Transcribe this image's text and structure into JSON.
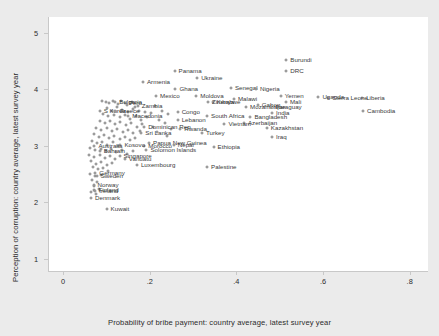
{
  "chart_data": {
    "type": "scatter",
    "title": "",
    "xlabel": "Probability of bribe payment: country average, latest survey year",
    "ylabel": "Perception of corruption: country average, latest survey year",
    "xlim": [
      -0.035,
      0.84
    ],
    "ylim": [
      0.78,
      5.28
    ],
    "xticks": [
      0,
      0.2,
      0.4,
      0.6,
      0.8
    ],
    "xticklabels": [
      "0",
      ".2",
      ".4",
      ".6",
      ".8"
    ],
    "yticks": [
      1,
      2,
      3,
      4,
      5
    ],
    "yticklabels": [
      "1",
      "2",
      "3",
      "4",
      "5"
    ],
    "grid": false,
    "legend": null,
    "marker": "open-circle",
    "points": [
      {
        "label": "Burundi",
        "x": 0.513,
        "y": 4.52
      },
      {
        "label": "DRC",
        "x": 0.513,
        "y": 4.33
      },
      {
        "label": "Panama",
        "x": 0.255,
        "y": 4.32
      },
      {
        "label": "Ukraine",
        "x": 0.307,
        "y": 4.2
      },
      {
        "label": "Armenia",
        "x": 0.182,
        "y": 4.12
      },
      {
        "label": "Senegal",
        "x": 0.385,
        "y": 4.02
      },
      {
        "label": "Nigeria",
        "x": 0.443,
        "y": 4.0
      },
      {
        "label": "Ghana",
        "x": 0.257,
        "y": 4.0
      },
      {
        "label": "Liberia",
        "x": 0.688,
        "y": 3.85
      },
      {
        "label": "Sierra Leone",
        "x": 0.61,
        "y": 3.85
      },
      {
        "label": "Uganda",
        "x": 0.587,
        "y": 3.87
      },
      {
        "label": "Yemen",
        "x": 0.5,
        "y": 3.88
      },
      {
        "label": "Malawi",
        "x": 0.392,
        "y": 3.82
      },
      {
        "label": "Mexico",
        "x": 0.212,
        "y": 3.88
      },
      {
        "label": "Moldova",
        "x": 0.305,
        "y": 3.88
      },
      {
        "label": "Kenya",
        "x": 0.343,
        "y": 3.78
      },
      {
        "label": "Zimbabwe",
        "x": 0.332,
        "y": 3.78
      },
      {
        "label": "Gabon",
        "x": 0.447,
        "y": 3.72
      },
      {
        "label": "Mali",
        "x": 0.512,
        "y": 3.78
      },
      {
        "label": "Mozambique",
        "x": 0.42,
        "y": 3.68
      },
      {
        "label": "Paraguay",
        "x": 0.478,
        "y": 3.68
      },
      {
        "label": "Cambodia",
        "x": 0.69,
        "y": 3.62
      },
      {
        "label": "Zambia",
        "x": 0.17,
        "y": 3.7
      },
      {
        "label": "S Korea",
        "x": 0.082,
        "y": 3.62
      },
      {
        "label": "Peru",
        "x": 0.14,
        "y": 3.76
      },
      {
        "label": "Bulgaria",
        "x": 0.118,
        "y": 3.77
      },
      {
        "label": "Greece",
        "x": 0.118,
        "y": 3.62
      },
      {
        "label": "Congo",
        "x": 0.262,
        "y": 3.6
      },
      {
        "label": "India",
        "x": 0.48,
        "y": 3.58
      },
      {
        "label": "South Africa",
        "x": 0.33,
        "y": 3.52
      },
      {
        "label": "Bangladesh",
        "x": 0.43,
        "y": 3.5
      },
      {
        "label": "Macedonia",
        "x": 0.148,
        "y": 3.52
      },
      {
        "label": "Lebanon",
        "x": 0.262,
        "y": 3.45
      },
      {
        "label": "Azerbaijan",
        "x": 0.415,
        "y": 3.4
      },
      {
        "label": "Vietnam",
        "x": 0.37,
        "y": 3.38
      },
      {
        "label": "Dominican Rep",
        "x": 0.185,
        "y": 3.34
      },
      {
        "label": "Rwanda",
        "x": 0.268,
        "y": 3.3
      },
      {
        "label": "Kazakhstan",
        "x": 0.468,
        "y": 3.32
      },
      {
        "label": "Turkey",
        "x": 0.318,
        "y": 3.22
      },
      {
        "label": "Sri Lanka",
        "x": 0.178,
        "y": 3.22
      },
      {
        "label": "Iraq",
        "x": 0.48,
        "y": 3.15
      },
      {
        "label": "Papua New Guinea",
        "x": 0.196,
        "y": 3.05
      },
      {
        "label": "Nepal",
        "x": 0.253,
        "y": 3.02
      },
      {
        "label": "Morocco",
        "x": 0.185,
        "y": 3.0
      },
      {
        "label": "Ethiopia",
        "x": 0.345,
        "y": 2.98
      },
      {
        "label": "Kosovo",
        "x": 0.13,
        "y": 3.02
      },
      {
        "label": "Australia",
        "x": 0.07,
        "y": 3.0
      },
      {
        "label": "Solomon Islands",
        "x": 0.19,
        "y": 2.92
      },
      {
        "label": "Bahrain",
        "x": 0.082,
        "y": 2.9
      },
      {
        "label": "Singapore",
        "x": 0.128,
        "y": 2.82
      },
      {
        "label": "Vanuatu",
        "x": 0.14,
        "y": 2.76
      },
      {
        "label": "Luxembourg",
        "x": 0.168,
        "y": 2.66
      },
      {
        "label": "Palestine",
        "x": 0.33,
        "y": 2.62
      },
      {
        "label": "Germany",
        "x": 0.072,
        "y": 2.52
      },
      {
        "label": "Sweden",
        "x": 0.075,
        "y": 2.46
      },
      {
        "label": "Norway",
        "x": 0.068,
        "y": 2.3
      },
      {
        "label": "Finland",
        "x": 0.07,
        "y": 2.22
      },
      {
        "label": "Ireland",
        "x": 0.072,
        "y": 2.2
      },
      {
        "label": "Denmark",
        "x": 0.062,
        "y": 2.08
      },
      {
        "label": "Kuwait",
        "x": 0.098,
        "y": 1.88
      }
    ],
    "cluster_points": [
      {
        "x": 0.088,
        "y": 3.8
      },
      {
        "x": 0.096,
        "y": 3.78
      },
      {
        "x": 0.104,
        "y": 3.76
      },
      {
        "x": 0.112,
        "y": 3.79
      },
      {
        "x": 0.124,
        "y": 3.74
      },
      {
        "x": 0.132,
        "y": 3.8
      },
      {
        "x": 0.145,
        "y": 3.72
      },
      {
        "x": 0.156,
        "y": 3.78
      },
      {
        "x": 0.164,
        "y": 3.69
      },
      {
        "x": 0.1,
        "y": 3.66
      },
      {
        "x": 0.11,
        "y": 3.62
      },
      {
        "x": 0.122,
        "y": 3.68
      },
      {
        "x": 0.134,
        "y": 3.64
      },
      {
        "x": 0.148,
        "y": 3.6
      },
      {
        "x": 0.16,
        "y": 3.65
      },
      {
        "x": 0.172,
        "y": 3.62
      },
      {
        "x": 0.186,
        "y": 3.6
      },
      {
        "x": 0.2,
        "y": 3.58
      },
      {
        "x": 0.09,
        "y": 3.56
      },
      {
        "x": 0.102,
        "y": 3.52
      },
      {
        "x": 0.116,
        "y": 3.55
      },
      {
        "x": 0.128,
        "y": 3.5
      },
      {
        "x": 0.14,
        "y": 3.54
      },
      {
        "x": 0.152,
        "y": 3.48
      },
      {
        "x": 0.166,
        "y": 3.52
      },
      {
        "x": 0.178,
        "y": 3.46
      },
      {
        "x": 0.192,
        "y": 3.5
      },
      {
        "x": 0.082,
        "y": 3.44
      },
      {
        "x": 0.094,
        "y": 3.4
      },
      {
        "x": 0.106,
        "y": 3.43
      },
      {
        "x": 0.118,
        "y": 3.38
      },
      {
        "x": 0.13,
        "y": 3.42
      },
      {
        "x": 0.142,
        "y": 3.36
      },
      {
        "x": 0.154,
        "y": 3.4
      },
      {
        "x": 0.168,
        "y": 3.34
      },
      {
        "x": 0.18,
        "y": 3.38
      },
      {
        "x": 0.074,
        "y": 3.32
      },
      {
        "x": 0.086,
        "y": 3.28
      },
      {
        "x": 0.098,
        "y": 3.31
      },
      {
        "x": 0.11,
        "y": 3.26
      },
      {
        "x": 0.122,
        "y": 3.3
      },
      {
        "x": 0.136,
        "y": 3.24
      },
      {
        "x": 0.148,
        "y": 3.28
      },
      {
        "x": 0.16,
        "y": 3.22
      },
      {
        "x": 0.174,
        "y": 3.26
      },
      {
        "x": 0.068,
        "y": 3.2
      },
      {
        "x": 0.08,
        "y": 3.16
      },
      {
        "x": 0.092,
        "y": 3.19
      },
      {
        "x": 0.104,
        "y": 3.14
      },
      {
        "x": 0.116,
        "y": 3.18
      },
      {
        "x": 0.128,
        "y": 3.12
      },
      {
        "x": 0.14,
        "y": 3.16
      },
      {
        "x": 0.152,
        "y": 3.1
      },
      {
        "x": 0.164,
        "y": 3.14
      },
      {
        "x": 0.064,
        "y": 3.08
      },
      {
        "x": 0.076,
        "y": 3.04
      },
      {
        "x": 0.088,
        "y": 3.07
      },
      {
        "x": 0.1,
        "y": 3.02
      },
      {
        "x": 0.112,
        "y": 3.06
      },
      {
        "x": 0.124,
        "y": 3.0
      },
      {
        "x": 0.06,
        "y": 2.96
      },
      {
        "x": 0.072,
        "y": 2.92
      },
      {
        "x": 0.084,
        "y": 2.95
      },
      {
        "x": 0.096,
        "y": 2.9
      },
      {
        "x": 0.108,
        "y": 2.94
      },
      {
        "x": 0.12,
        "y": 2.88
      },
      {
        "x": 0.134,
        "y": 2.92
      },
      {
        "x": 0.146,
        "y": 2.86
      },
      {
        "x": 0.158,
        "y": 2.9
      },
      {
        "x": 0.058,
        "y": 2.84
      },
      {
        "x": 0.07,
        "y": 2.8
      },
      {
        "x": 0.082,
        "y": 2.83
      },
      {
        "x": 0.094,
        "y": 2.78
      },
      {
        "x": 0.106,
        "y": 2.82
      },
      {
        "x": 0.118,
        "y": 2.76
      },
      {
        "x": 0.062,
        "y": 2.72
      },
      {
        "x": 0.074,
        "y": 2.68
      },
      {
        "x": 0.086,
        "y": 2.71
      },
      {
        "x": 0.098,
        "y": 2.66
      },
      {
        "x": 0.11,
        "y": 2.7
      },
      {
        "x": 0.066,
        "y": 2.62
      },
      {
        "x": 0.078,
        "y": 2.58
      },
      {
        "x": 0.09,
        "y": 2.6
      },
      {
        "x": 0.102,
        "y": 2.56
      },
      {
        "x": 0.06,
        "y": 2.5
      },
      {
        "x": 0.072,
        "y": 2.46
      },
      {
        "x": 0.084,
        "y": 2.48
      },
      {
        "x": 0.064,
        "y": 2.4
      },
      {
        "x": 0.076,
        "y": 2.36
      },
      {
        "x": 0.068,
        "y": 2.28
      },
      {
        "x": 0.08,
        "y": 2.24
      },
      {
        "x": 0.062,
        "y": 2.18
      },
      {
        "x": 0.074,
        "y": 2.14
      },
      {
        "x": 0.21,
        "y": 3.7
      },
      {
        "x": 0.225,
        "y": 3.62
      },
      {
        "x": 0.24,
        "y": 3.56
      },
      {
        "x": 0.218,
        "y": 3.46
      },
      {
        "x": 0.232,
        "y": 3.4
      },
      {
        "x": 0.205,
        "y": 3.34
      },
      {
        "x": 0.246,
        "y": 3.3
      },
      {
        "x": 0.214,
        "y": 3.24
      },
      {
        "x": 0.238,
        "y": 3.18
      }
    ]
  }
}
